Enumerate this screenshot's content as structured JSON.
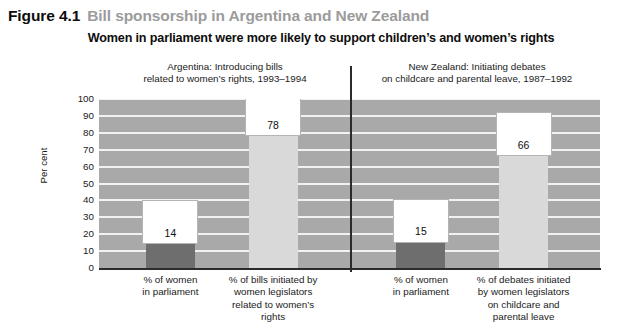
{
  "header": {
    "figure_number": "Figure 4.1",
    "figure_title": "Bill sponsorship in Argentina and New Zealand",
    "number_color": "#0d0d0d",
    "title_color": "#9b9b9b"
  },
  "chart_data": {
    "type": "bar",
    "title": "Women in parliament were more likely to support children’s and women’s rights",
    "xlabel": "",
    "ylabel": "Per cent",
    "ylim": [
      0,
      100
    ],
    "ytick_step": 10,
    "yticks": [
      100,
      90,
      80,
      70,
      60,
      50,
      40,
      30,
      20,
      10,
      0
    ],
    "grid": true,
    "legend": "none",
    "panels": [
      {
        "name": "argentina",
        "caption_line1": "Argentina: Introducing bills",
        "caption_line2": "related to women’s rights, 1993–1994",
        "categories": [
          "% of women\nin parliament",
          "% of bills initiated by\nwomen legislators\nrelated to women’s\nrights"
        ],
        "category_lines": [
          [
            "% of women",
            "in parliament"
          ],
          [
            "% of bills initiated by",
            "women legislators",
            "related to women’s",
            "rights"
          ]
        ],
        "values": [
          14,
          78
        ],
        "value_labels": [
          "14",
          "78"
        ],
        "bar_colors": [
          "#6e6e6e",
          "#d9d9d9"
        ]
      },
      {
        "name": "new-zealand",
        "caption_line1": "New Zealand: Initiating debates",
        "caption_line2": "on childcare and parental leave, 1987–1992",
        "categories": [
          "% of women\nin parliament",
          "% of debates initiated\nby women legislators\non childcare and\nparental leave"
        ],
        "category_lines": [
          [
            "% of women",
            "in parliament"
          ],
          [
            "% of debates initiated",
            "by women legislators",
            "on childcare and",
            "parental leave"
          ]
        ],
        "values": [
          15,
          66
        ],
        "value_labels": [
          "15",
          "66"
        ],
        "bar_colors": [
          "#6e6e6e",
          "#d9d9d9"
        ]
      }
    ],
    "colors": {
      "plot_background": "#a9a9a9",
      "gridline": "#f2f2f2",
      "axis": "#2b2b2b",
      "bar_dark": "#6e6e6e",
      "bar_light": "#d9d9d9",
      "value_box_fill": "#ffffff"
    }
  }
}
